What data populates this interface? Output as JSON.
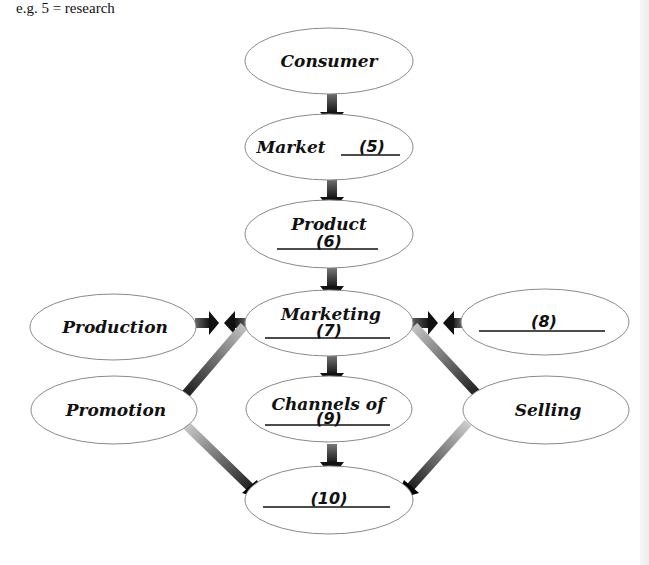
{
  "note": "e.g. 5 = research",
  "nodes": {
    "consumer": {
      "label": "Consumer"
    },
    "market": {
      "label": "Market",
      "blank": "(5)"
    },
    "product": {
      "label": "Product",
      "blank": "(6)"
    },
    "marketing": {
      "label": "Marketing",
      "blank": "(7)"
    },
    "production": {
      "label": "Production"
    },
    "eight": {
      "blank": "(8)"
    },
    "promotion": {
      "label": "Promotion"
    },
    "channels": {
      "label": "Channels of",
      "blank": "(9)"
    },
    "selling": {
      "label": "Selling"
    },
    "ten": {
      "blank": "(10)"
    }
  },
  "edges": [
    {
      "from": "Consumer",
      "to": "Market"
    },
    {
      "from": "Market",
      "to": "Product"
    },
    {
      "from": "Product",
      "to": "Marketing"
    },
    {
      "from": "Production",
      "to": "Marketing",
      "bidirectional_pair": true
    },
    {
      "from": "(8)",
      "to": "Marketing",
      "bidirectional_pair": true
    },
    {
      "from": "Marketing",
      "to": "Promotion"
    },
    {
      "from": "Marketing",
      "to": "Channels of (9)"
    },
    {
      "from": "Marketing",
      "to": "Selling"
    },
    {
      "from": "Promotion",
      "to": "(10)"
    },
    {
      "from": "Channels of (9)",
      "to": "(10)"
    },
    {
      "from": "Selling",
      "to": "(10)"
    }
  ],
  "colors": {
    "ellipse_stroke": "#8a8a8a",
    "arrow_dark": "#111111",
    "arrow_light": "#bdbdbd"
  }
}
